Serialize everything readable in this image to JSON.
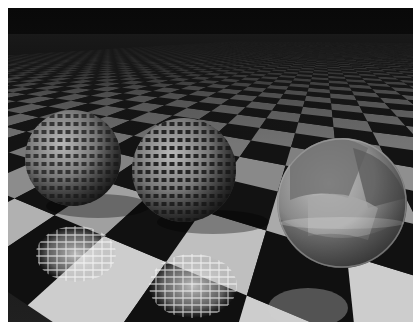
{
  "image": {
    "description": "Ray-traced grayscale render: two perforated spheres and one glossy reflective sphere on an infinite checkerboard floor under a dark sky, with mirror reflections on the floor",
    "frame": {
      "x": 8,
      "y": 8,
      "width": 405,
      "height": 314
    },
    "colors": {
      "sky_top": "#0a0a0a",
      "sky_horizon": "#1e1e1e",
      "tile_light": "#c4c4c4",
      "tile_dark": "#141414",
      "tile_far": "#3a3a3a",
      "border": "#ffffff"
    },
    "floor": {
      "horizon_y": 28,
      "vanish_x": 330,
      "columns": 26,
      "rows": 30
    },
    "spheres": [
      {
        "name": "perforated-sphere-left",
        "cx": 65,
        "cy": 150,
        "r": 48,
        "material": "perforated metal grid",
        "base": "#7a7a7a"
      },
      {
        "name": "perforated-sphere-middle",
        "cx": 176,
        "cy": 162,
        "r": 52,
        "material": "perforated metal grid",
        "base": "#7e7e7e"
      },
      {
        "name": "glossy-sphere-right",
        "cx": 334,
        "cy": 195,
        "r": 65,
        "material": "glossy glass reflecting checkerboard",
        "base": "#8a8a8a"
      }
    ],
    "reflections": [
      {
        "name": "reflection-left-sphere",
        "cx": 68,
        "cy": 246,
        "rx": 40,
        "ry": 28
      },
      {
        "name": "reflection-middle-sphere",
        "cx": 185,
        "cy": 278,
        "rx": 44,
        "ry": 32
      },
      {
        "name": "reflection-right-sphere",
        "cx": 300,
        "cy": 300,
        "rx": 40,
        "ry": 20
      }
    ]
  }
}
